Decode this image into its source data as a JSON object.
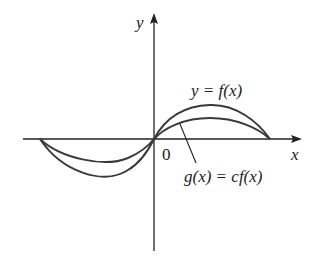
{
  "diagram": {
    "axes": {
      "x_label": "x",
      "y_label": "y",
      "origin_label": "0"
    },
    "curves": [
      {
        "name": "f",
        "label": "y = f(x)",
        "description": "outer sine-like curve (larger amplitude)"
      },
      {
        "name": "g",
        "label": "g(x) = cf(x)",
        "description": "inner curve, vertical compression of f (0 < c < 1)"
      }
    ],
    "colors": {
      "axis": "#222222",
      "curve": "#3a3a3a",
      "background": "#ffffff"
    }
  }
}
